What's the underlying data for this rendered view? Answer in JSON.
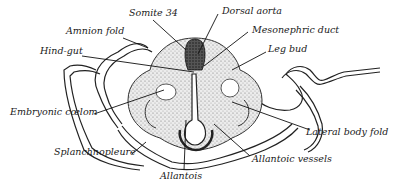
{
  "figure": {
    "labels": [
      {
        "id": "somite",
        "text": "Somite 34"
      },
      {
        "id": "dorsal_aorta",
        "text": "Dorsal aorta"
      },
      {
        "id": "amnion_fold",
        "text": "Amnion fold"
      },
      {
        "id": "mesonephric_duct",
        "text": "Mesonephric duct"
      },
      {
        "id": "hind_gut",
        "text": "Hind-gut"
      },
      {
        "id": "leg_bud",
        "text": "Leg bud"
      },
      {
        "id": "embryonic_coelom",
        "text": "Embryonic cœlom"
      },
      {
        "id": "lateral_body_fold",
        "text": "Lateral body fold"
      },
      {
        "id": "splanchnopleure",
        "text": "Splanchnopleure"
      },
      {
        "id": "allantoic_vessels",
        "text": "Allantoic vessels"
      },
      {
        "id": "allantois",
        "text": "Allantois"
      }
    ]
  },
  "colors": {
    "ink": "#1a1a1a",
    "tissue": "#d9d9d9",
    "dark_tissue": "#3a3a3a",
    "background": "#ffffff"
  }
}
